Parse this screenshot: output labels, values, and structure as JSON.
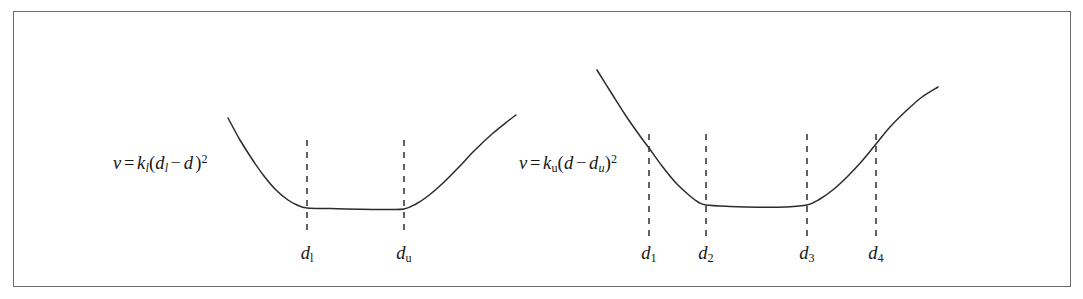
{
  "figure": {
    "name": "piecewise-quadratic-distance-restraint-potentials",
    "frame": {
      "border_color": "#6e6e6e",
      "background": "#ffffff"
    },
    "curve_color": "#2b2b2b",
    "dash_color": "#3a3a3a"
  },
  "panels": [
    {
      "id": "left-panel",
      "name": "flat-bottomed-two-bound-potential",
      "equations": [
        {
          "id": "left-lower-bound-equation",
          "text": "v = k_l(d_l - d)^2",
          "parts": {
            "v": "v",
            "equals": "=",
            "k": "k",
            "k_sub": "l",
            "open_paren": "(",
            "d1": "d",
            "d1_sub": "l",
            "minus": "−",
            "d2": "d",
            "close_paren": ")",
            "exponent": "2"
          },
          "x": 113,
          "y": 152
        },
        {
          "id": "left-upper-bound-equation",
          "text": "v = k_u(d - d_u)^2",
          "parts": {
            "v": "v",
            "equals": "=",
            "k": "k",
            "k_sub": "u",
            "open_paren": "(",
            "d1": "d",
            "minus": "−",
            "d2": "d",
            "d2_sub": "u",
            "close_paren": ")",
            "exponent": "2"
          },
          "x": 519,
          "y": 152
        }
      ],
      "ticks": [
        {
          "id": "left-tick-dl",
          "label_base": "d",
          "label_sub": "l",
          "x": 307
        },
        {
          "id": "left-tick-du",
          "label_base": "d",
          "label_sub": "u",
          "x": 404
        }
      ]
    },
    {
      "id": "right-panel",
      "name": "four-bound-staged-potential",
      "equations": [],
      "ticks": [
        {
          "id": "right-tick-d1",
          "label_base": "d",
          "label_sub": "1",
          "x": 649
        },
        {
          "id": "right-tick-d2",
          "label_base": "d",
          "label_sub": "2",
          "x": 706
        },
        {
          "id": "right-tick-d3",
          "label_base": "d",
          "label_sub": "3",
          "x": 807
        },
        {
          "id": "right-tick-d4",
          "label_base": "d",
          "label_sub": "4",
          "x": 876
        }
      ]
    }
  ],
  "chart_data": {
    "type": "line",
    "title": "",
    "xlabel": "",
    "ylabel": "",
    "grid": false,
    "legend": null,
    "axis_ranges": {
      "x": [
        13,
        1071
      ],
      "y": [
        11,
        287
      ]
    },
    "series": [
      {
        "name": "left-potential-curve",
        "comment": "Flat-bottomed potential: quadratic below d_l, zero between d_l and d_u, quadratic above d_u",
        "points": [
          [
            228,
            118
          ],
          [
            240,
            140
          ],
          [
            252,
            159
          ],
          [
            264,
            176
          ],
          [
            276,
            190
          ],
          [
            288,
            200
          ],
          [
            297,
            205
          ],
          [
            307,
            208
          ],
          [
            330,
            208.6
          ],
          [
            360,
            209.2
          ],
          [
            385,
            209.4
          ],
          [
            404,
            209
          ],
          [
            416,
            204
          ],
          [
            428,
            196
          ],
          [
            442,
            184
          ],
          [
            458,
            168
          ],
          [
            474,
            151
          ],
          [
            492,
            134
          ],
          [
            508,
            121
          ],
          [
            516,
            115
          ]
        ]
      },
      {
        "name": "right-potential-curve",
        "comment": "Staged potential: steep quadratic below d_2, flat basin d_2..d_3, quadratic rise above d_3",
        "points": [
          [
            597,
            70
          ],
          [
            612,
            94
          ],
          [
            626,
            116
          ],
          [
            640,
            136
          ],
          [
            649,
            148
          ],
          [
            662,
            166
          ],
          [
            676,
            183
          ],
          [
            690,
            196
          ],
          [
            698,
            202
          ],
          [
            706,
            205
          ],
          [
            730,
            206.4
          ],
          [
            760,
            207.2
          ],
          [
            785,
            207
          ],
          [
            807,
            205
          ],
          [
            820,
            199
          ],
          [
            834,
            189
          ],
          [
            848,
            176
          ],
          [
            862,
            161
          ],
          [
            876,
            144
          ],
          [
            890,
            127
          ],
          [
            906,
            111
          ],
          [
            922,
            97
          ],
          [
            938,
            87
          ]
        ]
      }
    ],
    "vertical_dashed_lines": [
      {
        "label": "d_l",
        "x": 307,
        "y_top": 140,
        "y_bottom": 236
      },
      {
        "label": "d_u",
        "x": 404,
        "y_top": 140,
        "y_bottom": 236
      },
      {
        "label": "d_1",
        "x": 649,
        "y_top": 134,
        "y_bottom": 236
      },
      {
        "label": "d_2",
        "x": 706,
        "y_top": 134,
        "y_bottom": 236
      },
      {
        "label": "d_3",
        "x": 807,
        "y_top": 134,
        "y_bottom": 236
      },
      {
        "label": "d_4",
        "x": 876,
        "y_top": 134,
        "y_bottom": 236
      }
    ]
  }
}
